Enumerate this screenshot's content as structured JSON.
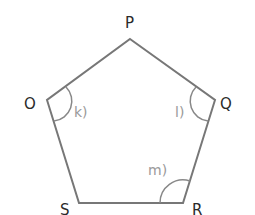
{
  "diagram": {
    "type": "pentagon",
    "colors": {
      "edge": "#777777",
      "vertex_label": "#2a2a2a",
      "angle_label": "#9a9a9a",
      "background": "#ffffff"
    },
    "vertices": [
      {
        "name": "P",
        "x": 130,
        "y": 39
      },
      {
        "name": "Q",
        "x": 215,
        "y": 100
      },
      {
        "name": "R",
        "x": 183,
        "y": 203
      },
      {
        "name": "S",
        "x": 79,
        "y": 203
      },
      {
        "name": "O",
        "x": 47,
        "y": 100
      }
    ],
    "vertex_labels": {
      "P": "P",
      "Q": "Q",
      "R": "R",
      "S": "S",
      "O": "O"
    },
    "angles": [
      {
        "vertex": "O",
        "label": "k)"
      },
      {
        "vertex": "Q",
        "label": "l)"
      },
      {
        "vertex": "R",
        "label": "m)"
      }
    ]
  }
}
